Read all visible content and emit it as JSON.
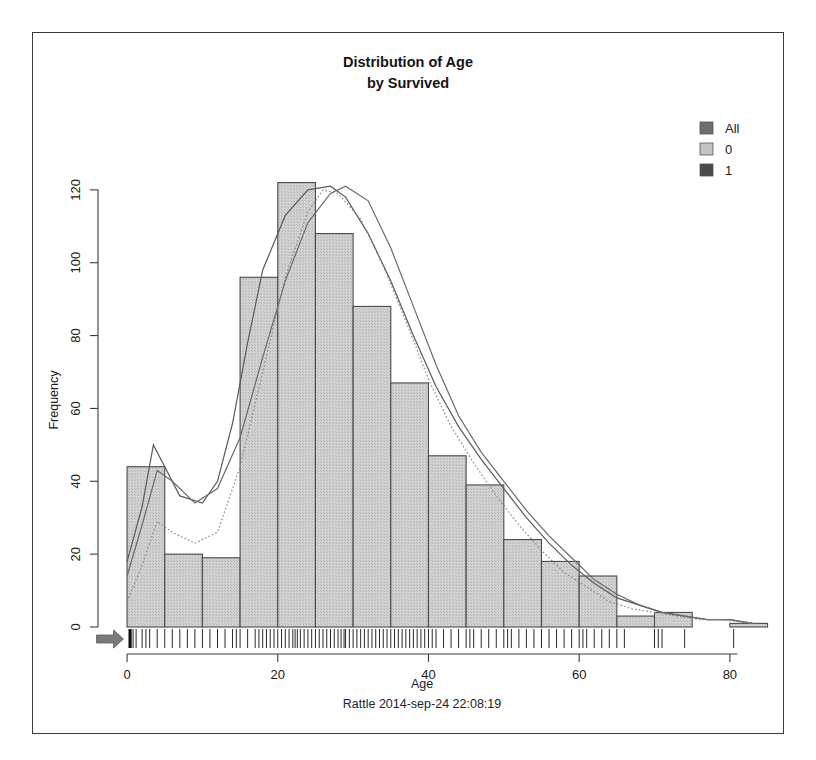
{
  "figure": {
    "title_line1": "Distribution of Age",
    "title_line2": "by Survived",
    "footer": "Rattle 2014-sep-24 22:08:19",
    "border_color": "#3a3a3a",
    "bar_fill": "#c9c9c9",
    "bar_stroke": "#4a4a4a",
    "axis_color": "#3c3c3c",
    "rug_color": "#2a2a2a",
    "arrow_color": "#7a7a7a"
  },
  "legend": {
    "position": "top-right",
    "items": [
      {
        "label": "All",
        "swatch": "#6e6e6e"
      },
      {
        "label": "0",
        "swatch": "#c4c4c4"
      },
      {
        "label": "1",
        "swatch": "#4a4a4a"
      }
    ]
  },
  "chart_data": {
    "type": "bar",
    "title": "Distribution of Age by Survived",
    "xlabel": "Age",
    "ylabel": "Frequency",
    "xlim": [
      -2,
      84
    ],
    "ylim": [
      0,
      126
    ],
    "xticks": [
      0,
      20,
      40,
      60,
      80
    ],
    "yticks": [
      0,
      20,
      40,
      60,
      80,
      100,
      120
    ],
    "grid": false,
    "bin_width": 5,
    "bin_starts": [
      0,
      5,
      10,
      15,
      20,
      25,
      30,
      35,
      40,
      45,
      50,
      55,
      60,
      65,
      70,
      75,
      80
    ],
    "categories": [
      "0-5",
      "5-10",
      "10-15",
      "15-20",
      "20-25",
      "25-30",
      "30-35",
      "35-40",
      "40-45",
      "45-50",
      "50-55",
      "55-60",
      "60-65",
      "65-70",
      "70-75",
      "75-80",
      "80-85"
    ],
    "values": [
      44,
      20,
      19,
      96,
      122,
      108,
      88,
      67,
      47,
      39,
      24,
      18,
      14,
      3,
      4,
      0,
      1
    ],
    "series": [
      {
        "name": "All",
        "type": "density",
        "linestyle": "solid",
        "color": "#5a5a5a",
        "points": [
          [
            0,
            18
          ],
          [
            2,
            33
          ],
          [
            3.5,
            50
          ],
          [
            5,
            44
          ],
          [
            7,
            36
          ],
          [
            10,
            34
          ],
          [
            12,
            40
          ],
          [
            14,
            56
          ],
          [
            16,
            78
          ],
          [
            18,
            98
          ],
          [
            21,
            113
          ],
          [
            24,
            120
          ],
          [
            27,
            121
          ],
          [
            29,
            118
          ],
          [
            32,
            108
          ],
          [
            35,
            95
          ],
          [
            38,
            80
          ],
          [
            41,
            66
          ],
          [
            44,
            55
          ],
          [
            47,
            46
          ],
          [
            50,
            38
          ],
          [
            53,
            30
          ],
          [
            56,
            23
          ],
          [
            59,
            17
          ],
          [
            62,
            12
          ],
          [
            65,
            8
          ],
          [
            68,
            6
          ],
          [
            71,
            4
          ],
          [
            74,
            3
          ],
          [
            77,
            2
          ],
          [
            80,
            2
          ],
          [
            83,
            1
          ]
        ]
      },
      {
        "name": "0",
        "type": "density",
        "linestyle": "solid",
        "color": "#6a6a6a",
        "points": [
          [
            0,
            14
          ],
          [
            2,
            28
          ],
          [
            4,
            43
          ],
          [
            6,
            40
          ],
          [
            9,
            34
          ],
          [
            12,
            38
          ],
          [
            15,
            52
          ],
          [
            18,
            74
          ],
          [
            21,
            95
          ],
          [
            24,
            111
          ],
          [
            27,
            119
          ],
          [
            29,
            121
          ],
          [
            32,
            117
          ],
          [
            35,
            104
          ],
          [
            38,
            88
          ],
          [
            41,
            72
          ],
          [
            44,
            58
          ],
          [
            47,
            48
          ],
          [
            50,
            40
          ],
          [
            53,
            32
          ],
          [
            56,
            25
          ],
          [
            59,
            19
          ],
          [
            62,
            13
          ],
          [
            65,
            9
          ],
          [
            68,
            6
          ],
          [
            71,
            4
          ],
          [
            74,
            3
          ],
          [
            77,
            2
          ],
          [
            80,
            2
          ],
          [
            83,
            1
          ]
        ]
      },
      {
        "name": "1",
        "type": "density",
        "linestyle": "dotted",
        "color": "#8a8a8a",
        "points": [
          [
            0,
            7
          ],
          [
            2,
            17
          ],
          [
            4,
            29
          ],
          [
            6,
            26
          ],
          [
            9,
            23
          ],
          [
            12,
            26
          ],
          [
            15,
            44
          ],
          [
            18,
            70
          ],
          [
            21,
            96
          ],
          [
            24,
            114
          ],
          [
            26,
            120
          ],
          [
            28,
            119
          ],
          [
            31,
            112
          ],
          [
            34,
            99
          ],
          [
            37,
            84
          ],
          [
            40,
            68
          ],
          [
            43,
            55
          ],
          [
            46,
            45
          ],
          [
            49,
            36
          ],
          [
            52,
            28
          ],
          [
            55,
            21
          ],
          [
            58,
            15
          ],
          [
            61,
            11
          ],
          [
            64,
            7
          ],
          [
            67,
            5
          ],
          [
            70,
            4
          ],
          [
            73,
            3
          ],
          [
            76,
            2
          ],
          [
            79,
            2
          ],
          [
            83,
            1
          ]
        ]
      }
    ],
    "rug": {
      "label": "rug-plot",
      "positions": [
        0.4,
        0.8,
        1.2,
        2,
        2.5,
        3,
        4,
        5,
        6,
        7,
        8,
        9,
        10,
        11,
        12,
        13,
        14,
        14.5,
        15,
        16,
        17,
        17.5,
        18,
        18.5,
        19,
        19.5,
        20,
        20.5,
        21,
        21.5,
        22,
        22.3,
        22.6,
        23,
        23.5,
        24,
        24.5,
        25,
        25.5,
        26,
        26.5,
        27,
        27.5,
        28,
        28.4,
        28.8,
        29,
        29.5,
        30,
        30.5,
        31,
        31.5,
        32,
        32.5,
        33,
        33.5,
        34,
        34.5,
        35,
        35.5,
        36,
        36.5,
        37,
        37.5,
        38,
        38.5,
        39,
        39.5,
        40,
        40.5,
        41,
        42,
        43,
        44,
        45,
        45.5,
        46,
        47,
        48,
        49,
        50,
        50.5,
        51,
        52,
        53,
        54,
        55,
        56,
        57,
        58,
        59,
        60,
        60.5,
        61,
        62,
        63,
        64,
        65,
        66,
        70,
        70.5,
        71,
        74,
        80.5
      ]
    },
    "annotations": [
      {
        "name": "left-arrow-marker",
        "x": -1.5,
        "y": 0,
        "shape": "arrow-right"
      }
    ]
  }
}
